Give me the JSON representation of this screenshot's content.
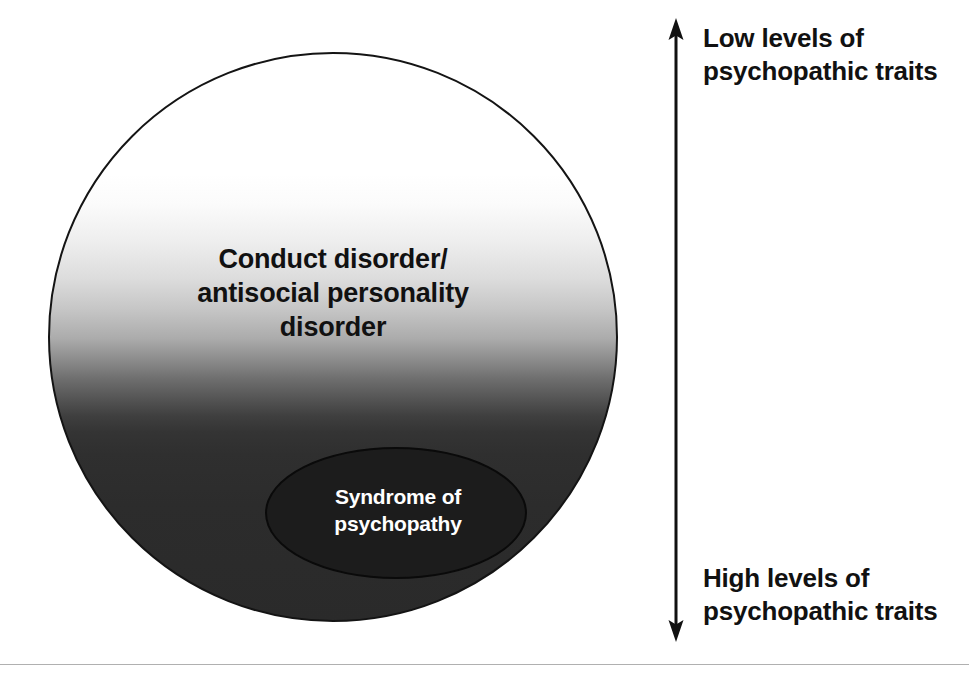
{
  "figure": {
    "outer_shape": {
      "label_line_1": "Conduct disorder/",
      "label_line_2": "antisocial personality",
      "label_line_3": "disorder"
    },
    "inner_shape": {
      "label_line_1": "Syndrome of",
      "label_line_2": "psychopathy"
    },
    "axis": {
      "arrow_name": "double-headed-vertical-arrow",
      "top_label": "Low levels of\npsychopathic traits",
      "bottom_label": "High levels of\npsychopathic traits"
    },
    "colors": {
      "gradient_top": "#ffffff",
      "gradient_bottom": "#2a2a2a",
      "inner_ellipse_fill": "#1c1c1c",
      "inner_ellipse_text": "#ffffff",
      "outline": "#141414",
      "text": "#111111",
      "rule": "#b0b0b0"
    }
  }
}
